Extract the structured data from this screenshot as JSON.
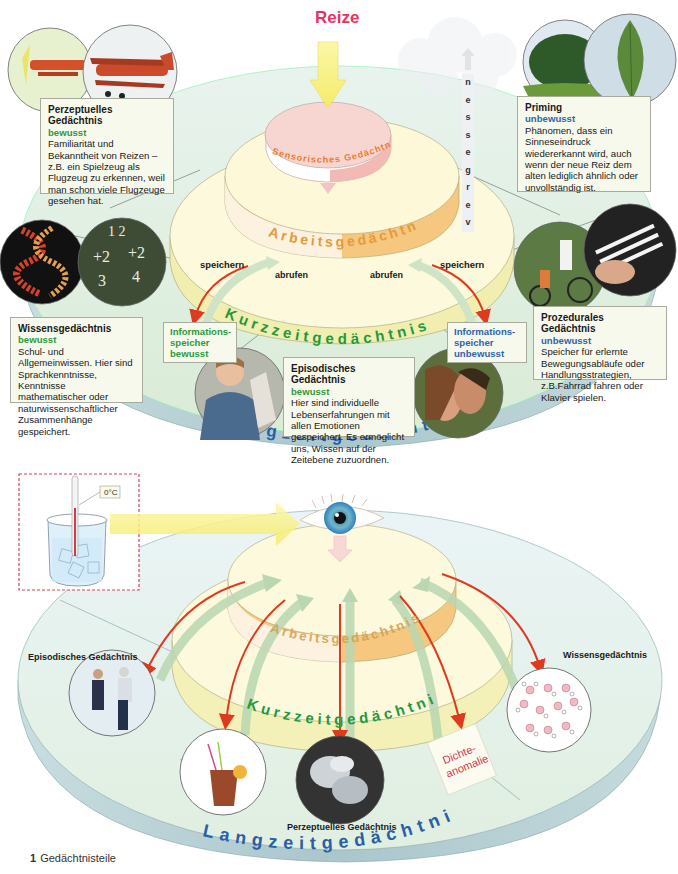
{
  "figure": {
    "caption_number": "1",
    "caption_text": "Gedächtnisteile"
  },
  "top_diagram": {
    "input_label": "Reize",
    "forgetting_label": "vergessen",
    "forgetting_letters": [
      "v",
      "e",
      "r",
      "g",
      "e",
      "s",
      "s",
      "e",
      "n"
    ],
    "layers": {
      "sensory": "Sensorisches Gedächtnis",
      "working": "Arbeitsgedächtnis",
      "short_term": "Kurzzeitgedächtnis",
      "long_term": "Langzeitgedächtnis"
    },
    "arrows": {
      "left_store": "speichern",
      "left_retrieve": "abrufen",
      "right_retrieve": "abrufen",
      "right_store": "speichern"
    },
    "info_stores": {
      "conscious": {
        "line1": "Informations-",
        "line2": "speicher",
        "line3": "bewusst"
      },
      "unconscious": {
        "line1": "Informations-",
        "line2": "speicher",
        "line3": "unbewusst"
      }
    },
    "cards": {
      "perceptual": {
        "title": "Perzeptuelles Gedächtnis",
        "type": "bewusst",
        "text": "Familiarität und Bekanntheit von Reizen – z.B. ein Spielzeug als Flugzeug zu erkennen, weil man schon viele Flugzeuge gesehen hat."
      },
      "priming": {
        "title": "Priming",
        "type": "unbewusst",
        "text": "Phänomen, dass ein Sinneseindruck wiedererkannt wird, auch wenn der neue Reiz dem alten lediglich ähnlich oder unvollständig ist."
      },
      "knowledge": {
        "title": "Wissensgedächtnis",
        "type": "bewusst",
        "text": "Schul- und Allgemeinwissen. Hier sind Sprachkenntnisse, Kenntnisse mathematischer oder naturwissenschaftlicher Zusammenhänge gespeichert."
      },
      "procedural": {
        "title": "Prozedurales Gedächtnis",
        "type": "unbewusst",
        "text": "Speicher für erlernte Bewegungsabläufe oder Handlungsstrategien, z.B.Fahrrad fahren oder Klavier spielen."
      },
      "episodic": {
        "title": "Episodisches Gedächtnis",
        "type": "bewusst",
        "text": "Hier sind individuelle Lebenserfahrungen mit allen Emotionen gespeichert. Es ermöglicht uns, Wissen auf der Zeitebene zuzuordnen."
      }
    },
    "photos": [
      "toy-airplane",
      "biplane",
      "tree",
      "leaf",
      "dna",
      "chalkboard-fractions",
      "cycling",
      "piano",
      "child-with-school-cone",
      "couple-kissing"
    ]
  },
  "bottom_diagram": {
    "thermometer_label": "0°C",
    "layers": {
      "working": "Arbeitsgedächtnis",
      "short_term": "Kurzzeitgedächtnis",
      "long_term": "Langzeitgedächtnis"
    },
    "labels": {
      "episodic": "Episodisches Gedächtnis",
      "perceptual": "Perzeptuelles Gedächtnis",
      "knowledge": "Wissensgedächtnis"
    },
    "note_card": {
      "line1": "Dichte-",
      "line2": "anomalie"
    },
    "photos": [
      "ice-skating",
      "iced-drink",
      "ice-cubes",
      "water-molecules"
    ]
  },
  "colors": {
    "reize_red": "#e8325e",
    "conscious_green": "#2f9a3a",
    "unconscious_blue": "#2e64b0",
    "arrow_red": "#e03a1e",
    "sensory_pink": "#f6d0cc",
    "working_orange": "#f0b560",
    "short_term_yellow": "#f6f3c4",
    "long_term_green": "#dff0dc",
    "long_term_side": "#a9c7cc"
  }
}
